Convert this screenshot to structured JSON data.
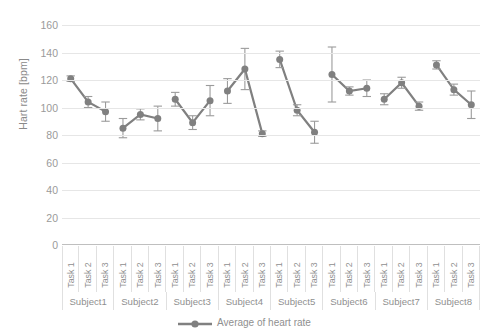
{
  "chart_data": {
    "type": "line",
    "title": "",
    "xlabel": "",
    "ylabel": "Hart rate [bpm]",
    "ylim": [
      0,
      160
    ],
    "ytick_step": 20,
    "yticks": [
      160,
      140,
      120,
      100,
      80,
      60,
      40,
      20,
      0
    ],
    "grid": true,
    "legend_position": "bottom",
    "legend_entries": [
      "Average of heart rate"
    ],
    "error_bars": true,
    "marker": "circle",
    "series_color": "#808080",
    "groups": [
      "Subject1",
      "Subject2",
      "Subject3",
      "Subject4",
      "Subject5",
      "Subject6",
      "Subject7",
      "Subject8"
    ],
    "subcategories": [
      "Task 1",
      "Task 2",
      "Task 3"
    ],
    "categories": [
      "Subject1 Task 1",
      "Subject1 Task 2",
      "Subject1 Task 3",
      "Subject2 Task 1",
      "Subject2 Task 2",
      "Subject2 Task 3",
      "Subject3 Task 1",
      "Subject3 Task 2",
      "Subject3 Task 3",
      "Subject4 Task 1",
      "Subject4 Task 2",
      "Subject4 Task 3",
      "Subject5 Task 1",
      "Subject5 Task 2",
      "Subject5 Task 3",
      "Subject6 Task 1",
      "Subject6 Task 2",
      "Subject6 Task 3",
      "Subject7 Task 1",
      "Subject7 Task 2",
      "Subject7 Task 3",
      "Subject8 Task 1",
      "Subject8 Task 2",
      "Subject8 Task 3"
    ],
    "series": [
      {
        "name": "Average of heart rate",
        "values": [
          121,
          104,
          97,
          85,
          95,
          92,
          106,
          89,
          105,
          112,
          128,
          81,
          135,
          98,
          82,
          124,
          112,
          114,
          106,
          118,
          101,
          131,
          113,
          102
        ],
        "errors": [
          2,
          4,
          7,
          7,
          4,
          9,
          5,
          5,
          11,
          9,
          15,
          2,
          6,
          4,
          8,
          20,
          3,
          6,
          4,
          4,
          3,
          3,
          4,
          10
        ]
      }
    ],
    "points": [
      {
        "group": "Subject1",
        "task": "Task 1",
        "value": 121,
        "error": 2
      },
      {
        "group": "Subject1",
        "task": "Task 2",
        "value": 104,
        "error": 4
      },
      {
        "group": "Subject1",
        "task": "Task 3",
        "value": 97,
        "error": 7
      },
      {
        "group": "Subject2",
        "task": "Task 1",
        "value": 85,
        "error": 7
      },
      {
        "group": "Subject2",
        "task": "Task 2",
        "value": 95,
        "error": 4
      },
      {
        "group": "Subject2",
        "task": "Task 3",
        "value": 92,
        "error": 9
      },
      {
        "group": "Subject3",
        "task": "Task 1",
        "value": 106,
        "error": 5
      },
      {
        "group": "Subject3",
        "task": "Task 2",
        "value": 89,
        "error": 5
      },
      {
        "group": "Subject3",
        "task": "Task 3",
        "value": 105,
        "error": 11
      },
      {
        "group": "Subject4",
        "task": "Task 1",
        "value": 112,
        "error": 9
      },
      {
        "group": "Subject4",
        "task": "Task 2",
        "value": 128,
        "error": 15
      },
      {
        "group": "Subject4",
        "task": "Task 3",
        "value": 81,
        "error": 2
      },
      {
        "group": "Subject5",
        "task": "Task 1",
        "value": 135,
        "error": 6
      },
      {
        "group": "Subject5",
        "task": "Task 2",
        "value": 98,
        "error": 4
      },
      {
        "group": "Subject5",
        "task": "Task 3",
        "value": 82,
        "error": 8
      },
      {
        "group": "Subject6",
        "task": "Task 1",
        "value": 124,
        "error": 20
      },
      {
        "group": "Subject6",
        "task": "Task 2",
        "value": 112,
        "error": 3
      },
      {
        "group": "Subject6",
        "task": "Task 3",
        "value": 114,
        "error": 6
      },
      {
        "group": "Subject7",
        "task": "Task 1",
        "value": 106,
        "error": 4
      },
      {
        "group": "Subject7",
        "task": "Task 2",
        "value": 118,
        "error": 4
      },
      {
        "group": "Subject7",
        "task": "Task 3",
        "value": 101,
        "error": 3
      },
      {
        "group": "Subject8",
        "task": "Task 1",
        "value": 131,
        "error": 3
      },
      {
        "group": "Subject8",
        "task": "Task 2",
        "value": 113,
        "error": 4
      },
      {
        "group": "Subject8",
        "task": "Task 3",
        "value": 102,
        "error": 10
      }
    ]
  },
  "legend": {
    "label": "Average of heart rate"
  },
  "axis": {
    "y_title": "Hart rate [bpm]"
  }
}
